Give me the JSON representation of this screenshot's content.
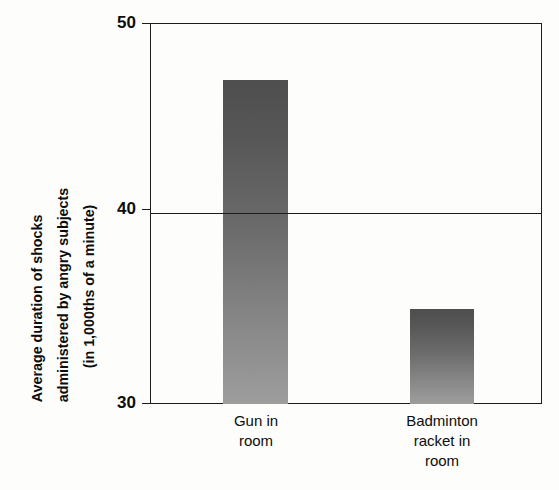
{
  "chart_data": {
    "type": "bar",
    "title": "",
    "subtitle": "",
    "categories": [
      "Gun in room",
      "Badminton racket in room"
    ],
    "category_lines": [
      [
        "Gun in",
        "room"
      ],
      [
        "Badminton",
        "racket in",
        "room"
      ]
    ],
    "values": [
      47,
      35
    ],
    "xlabel": "",
    "ylabel": "Average duration of shocks administered by angry subjects (in 1,000ths of a minute)",
    "ylabel_lines": [
      "Average duration of shocks",
      "administered by angry subjects",
      "(in 1,000ths of a minute)"
    ],
    "ylim": [
      30,
      50
    ],
    "yticks": [
      30,
      40,
      50
    ],
    "ytick_labels": [
      "30",
      "40",
      "50"
    ],
    "grid": "horizontal-at-40",
    "legend": "none",
    "bar_fill_top": "#4e4e4e",
    "bar_fill_bottom": "#9d9d9d",
    "axis_color": "#1c1c1c",
    "background": "#fdfdfc",
    "annotations": []
  },
  "artifacts": {
    "bleed_a": "",
    "bleed_b": ""
  }
}
